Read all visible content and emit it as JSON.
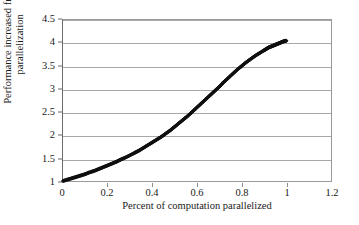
{
  "chart_data": {
    "type": "scatter",
    "title": "",
    "xlabel": "Percent of computation parallelized",
    "ylabel_lines": [
      "Performance increased from",
      "parallelization"
    ],
    "ylabel": "Performance increased from parallelization",
    "xlim": [
      0,
      1.2
    ],
    "ylim": [
      1,
      4.5
    ],
    "grid": true,
    "grid_axis": "y",
    "legend": false,
    "marker": "diamond",
    "marker_color": "#111111",
    "xticks": [
      0,
      0.2,
      0.4,
      0.6,
      0.8,
      1,
      1.2
    ],
    "xticklabels": [
      "0",
      "0.2",
      "0.4",
      "0.6",
      "0.8",
      "1",
      "1.2"
    ],
    "yticks": [
      1,
      1.5,
      2,
      2.5,
      3,
      3.5,
      4,
      4.5
    ],
    "yticklabels": [
      "1",
      "1.5",
      "2",
      "2.5",
      "3",
      "3.5",
      "4",
      "4.5"
    ],
    "series": [
      {
        "name": "speedup",
        "x": [
          0,
          0.02,
          0.04,
          0.06,
          0.08,
          0.1,
          0.12,
          0.14,
          0.16,
          0.18,
          0.2,
          0.22,
          0.24,
          0.26,
          0.28,
          0.3,
          0.32,
          0.34,
          0.36,
          0.38,
          0.4,
          0.42,
          0.44,
          0.46,
          0.48,
          0.5,
          0.52,
          0.54,
          0.56,
          0.58,
          0.6,
          0.62,
          0.64,
          0.66,
          0.68,
          0.7,
          0.72,
          0.74,
          0.76,
          0.78,
          0.8,
          0.82,
          0.84,
          0.86,
          0.88,
          0.9,
          0.91,
          0.92,
          0.93,
          0.94,
          0.95,
          0.96,
          0.97,
          0.98,
          0.99,
          1.0
        ],
        "y": [
          1.0,
          1.03,
          1.06,
          1.09,
          1.12,
          1.15,
          1.19,
          1.22,
          1.26,
          1.3,
          1.34,
          1.38,
          1.42,
          1.47,
          1.51,
          1.56,
          1.61,
          1.66,
          1.72,
          1.78,
          1.84,
          1.9,
          1.96,
          2.03,
          2.1,
          2.18,
          2.26,
          2.34,
          2.42,
          2.51,
          2.6,
          2.69,
          2.78,
          2.87,
          2.96,
          3.05,
          3.15,
          3.24,
          3.33,
          3.42,
          3.5,
          3.58,
          3.65,
          3.72,
          3.78,
          3.84,
          3.87,
          3.9,
          3.92,
          3.94,
          3.96,
          3.98,
          4.0,
          4.02,
          4.04,
          4.05
        ]
      }
    ]
  }
}
